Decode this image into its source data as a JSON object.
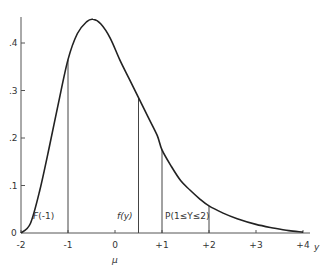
{
  "chart_data": {
    "type": "line",
    "title": "",
    "xlabel": "y",
    "ylabel": "",
    "xlim": [
      -2,
      4
    ],
    "ylim": [
      0,
      0.45
    ],
    "grid": false,
    "legend": null,
    "x_ticks": [
      -2,
      -1,
      0,
      1,
      2,
      3,
      4
    ],
    "x_tick_labels": [
      "-2",
      "-1",
      "0",
      "+1",
      "+2",
      "+3",
      "+4"
    ],
    "y_ticks": [
      0,
      0.1,
      0.2,
      0.3,
      0.4
    ],
    "y_tick_labels": [
      "0",
      ".1",
      ".2",
      ".3",
      ".4"
    ],
    "mu_label": "μ",
    "mu_position": 0,
    "series": [
      {
        "name": "density f(y)",
        "x": [
          -2.0,
          -1.8,
          -1.6,
          -1.4,
          -1.2,
          -1.0,
          -0.8,
          -0.6,
          -0.47,
          -0.3,
          -0.1,
          0.1,
          0.3,
          0.5,
          0.7,
          0.9,
          1.0,
          1.2,
          1.4,
          1.6,
          1.8,
          2.0,
          2.3,
          2.6,
          3.0,
          3.4,
          3.7,
          4.0
        ],
        "values": [
          0.0,
          0.02,
          0.09,
          0.18,
          0.275,
          0.365,
          0.42,
          0.445,
          0.45,
          0.44,
          0.41,
          0.365,
          0.325,
          0.285,
          0.245,
          0.205,
          0.175,
          0.14,
          0.11,
          0.09,
          0.072,
          0.057,
          0.042,
          0.03,
          0.018,
          0.01,
          0.005,
          0.002
        ]
      }
    ],
    "vertical_lines": [
      {
        "x": -1.0,
        "y": 0.365
      },
      {
        "x": 0.5,
        "y": 0.285
      },
      {
        "x": 1.0,
        "y": 0.175
      },
      {
        "x": 2.0,
        "y": 0.057
      }
    ],
    "annotations": [
      {
        "text": "F(-1)",
        "x": -1.55,
        "y": 0.02
      },
      {
        "text": "f(y)",
        "x": 0.3,
        "y": 0.02
      },
      {
        "text": "P(1 ≤ Y ≤ 2)",
        "x": 1.5,
        "y": 0.02
      }
    ]
  },
  "labels": {
    "annotation_F": "F(-1)",
    "annotation_f": "f(y)",
    "annotation_P": "P(1≤Y≤2)",
    "x_axis_var": "y",
    "mu": "μ"
  }
}
